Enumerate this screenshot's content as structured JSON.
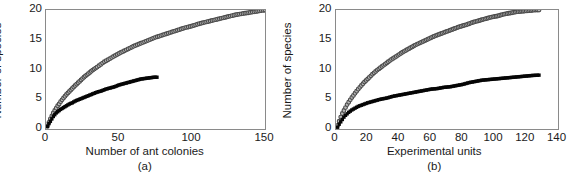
{
  "figure": {
    "ylabel": "Number of species",
    "panels": [
      {
        "key": "a",
        "letter": "(a)",
        "xlabel": "Number of ant colonies",
        "xticks": [
          "0",
          "50",
          "100",
          "150"
        ],
        "yticks": [
          "20",
          "15",
          "10",
          "5",
          "0"
        ]
      },
      {
        "key": "b",
        "letter": "(b)",
        "xlabel": "Experimental units",
        "xticks": [
          "0",
          "20",
          "40",
          "60",
          "80",
          "100",
          "120",
          "140"
        ],
        "yticks": [
          "20",
          "15",
          "10",
          "5",
          "0"
        ]
      }
    ]
  },
  "chart_data": [
    {
      "type": "scatter",
      "panel": "(a)",
      "title": "",
      "xlabel": "Number of ant colonies",
      "ylabel": "Number of species",
      "xlim": [
        0,
        150
      ],
      "ylim": [
        0,
        20
      ],
      "xticks": [
        0,
        50,
        100,
        150
      ],
      "yticks": [
        0,
        5,
        10,
        15,
        20
      ],
      "grid": false,
      "legend": "none",
      "series": [
        {
          "name": "Species accumulation by ant colonies sampled (open circles)",
          "marker": "open-circle",
          "color": "#b9b9b9",
          "edge_color": "#4a4a4a",
          "x": [
            1,
            2,
            3,
            4,
            5,
            6,
            7,
            8,
            9,
            10,
            12,
            14,
            16,
            18,
            20,
            23,
            26,
            29,
            32,
            35,
            40,
            45,
            50,
            55,
            60,
            65,
            70,
            75,
            80,
            85,
            90,
            95,
            100,
            105,
            110,
            115,
            120,
            125,
            130,
            135,
            140,
            145,
            150
          ],
          "y": [
            0.5,
            1.1,
            1.7,
            2.2,
            2.7,
            3.1,
            3.5,
            3.9,
            4.2,
            4.6,
            5.2,
            5.8,
            6.3,
            6.8,
            7.3,
            8.0,
            8.7,
            9.3,
            9.9,
            10.4,
            11.3,
            12.0,
            12.7,
            13.3,
            13.9,
            14.4,
            14.9,
            15.4,
            15.8,
            16.2,
            16.6,
            17.0,
            17.3,
            17.7,
            18.0,
            18.3,
            18.6,
            18.9,
            19.2,
            19.4,
            19.6,
            19.8,
            20.0
          ]
        },
        {
          "name": "Species accumulation by individuals (filled squares)",
          "marker": "filled-square",
          "color": "#050505",
          "x": [
            1,
            2,
            3,
            4,
            5,
            6,
            7,
            8,
            9,
            10,
            12,
            14,
            16,
            18,
            20,
            23,
            26,
            29,
            32,
            35,
            38,
            41,
            44,
            47,
            50,
            53,
            56,
            59,
            62,
            65,
            68,
            71,
            74,
            76
          ],
          "y": [
            0.4,
            0.9,
            1.3,
            1.7,
            2.1,
            2.4,
            2.7,
            2.9,
            3.1,
            3.3,
            3.6,
            3.9,
            4.2,
            4.4,
            4.7,
            5.0,
            5.3,
            5.6,
            5.9,
            6.2,
            6.4,
            6.7,
            6.9,
            7.1,
            7.4,
            7.6,
            7.8,
            8.0,
            8.2,
            8.4,
            8.5,
            8.6,
            8.7,
            8.7
          ]
        }
      ]
    },
    {
      "type": "scatter",
      "panel": "(b)",
      "title": "",
      "xlabel": "Experimental units",
      "ylabel": "Number of species",
      "xlim": [
        0,
        140
      ],
      "ylim": [
        0,
        20
      ],
      "xticks": [
        0,
        20,
        40,
        60,
        80,
        100,
        120,
        140
      ],
      "yticks": [
        0,
        5,
        10,
        15,
        20
      ],
      "grid": false,
      "legend": "none",
      "series": [
        {
          "name": "Species accumulation by experimental units (open circles)",
          "marker": "open-circle",
          "color": "#b9b9b9",
          "edge_color": "#4a4a4a",
          "x": [
            1,
            2,
            3,
            4,
            5,
            6,
            7,
            8,
            9,
            10,
            12,
            14,
            16,
            18,
            20,
            23,
            26,
            29,
            32,
            35,
            38,
            42,
            46,
            50,
            54,
            58,
            62,
            66,
            70,
            74,
            78,
            82,
            86,
            90,
            94,
            98,
            102,
            106,
            110,
            114,
            118,
            122,
            126,
            128
          ],
          "y": [
            0.6,
            1.3,
            2.0,
            2.6,
            3.1,
            3.6,
            4.1,
            4.5,
            4.9,
            5.3,
            6.0,
            6.7,
            7.3,
            7.9,
            8.4,
            9.2,
            9.9,
            10.5,
            11.1,
            11.7,
            12.2,
            12.9,
            13.5,
            14.1,
            14.6,
            15.1,
            15.6,
            16.0,
            16.4,
            16.8,
            17.2,
            17.5,
            17.9,
            18.2,
            18.5,
            18.8,
            19.0,
            19.3,
            19.5,
            19.7,
            19.8,
            19.9,
            20.0,
            20.0
          ]
        },
        {
          "name": "Species accumulation by individuals (filled squares)",
          "marker": "filled-square",
          "color": "#050505",
          "x": [
            1,
            2,
            3,
            4,
            5,
            6,
            8,
            10,
            12,
            14,
            16,
            18,
            20,
            24,
            28,
            32,
            36,
            40,
            44,
            48,
            52,
            56,
            60,
            64,
            68,
            72,
            76,
            80,
            84,
            88,
            92,
            96,
            100,
            104,
            108,
            112,
            116,
            120,
            124,
            128
          ],
          "y": [
            0.3,
            0.8,
            1.2,
            1.6,
            2.0,
            2.3,
            2.8,
            3.2,
            3.5,
            3.8,
            4.0,
            4.2,
            4.4,
            4.7,
            5.0,
            5.2,
            5.5,
            5.7,
            5.9,
            6.1,
            6.3,
            6.5,
            6.7,
            6.8,
            7.0,
            7.1,
            7.3,
            7.5,
            7.8,
            8.0,
            8.2,
            8.3,
            8.4,
            8.5,
            8.6,
            8.7,
            8.8,
            8.9,
            9.0,
            9.05
          ]
        }
      ]
    }
  ]
}
